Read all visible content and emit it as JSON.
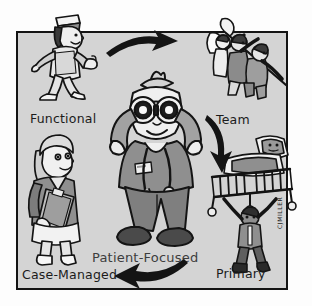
{
  "illustration": {
    "title_center": "Patient-Focused",
    "signature": "CJMILLER",
    "frame": {
      "background_color": "#d4d4d4",
      "border_color": "#141414"
    },
    "page_background": "#fdfdfd",
    "ink_color": "#141414",
    "midtone_color": "#8d8d8d",
    "highlight_color": "#f2f2f2"
  },
  "nodes": [
    {
      "id": "functional",
      "label": "Functional",
      "figure": "walking-nurse-with-cap",
      "position": "top-left"
    },
    {
      "id": "team",
      "label": "Team",
      "figure": "group-raising-flag",
      "position": "top-right"
    },
    {
      "id": "primary",
      "label": "Primary",
      "figure": "nurse-carrying-patient-bed-overhead",
      "position": "bottom-right"
    },
    {
      "id": "case-managed",
      "label": "Case-Managed",
      "figure": "nurse-with-clipboard",
      "position": "bottom-left"
    },
    {
      "id": "patient-focused",
      "label": "Patient-Focused",
      "figure": "nurse-with-binoculars-and-stethoscope",
      "position": "center"
    }
  ],
  "arrows": [
    {
      "id": "arrow-top",
      "direction": "right",
      "from": "functional",
      "to": "team"
    },
    {
      "id": "arrow-right",
      "direction": "down",
      "from": "team",
      "to": "primary"
    },
    {
      "id": "arrow-bottom",
      "direction": "left",
      "from": "primary",
      "to": "case-managed"
    }
  ]
}
